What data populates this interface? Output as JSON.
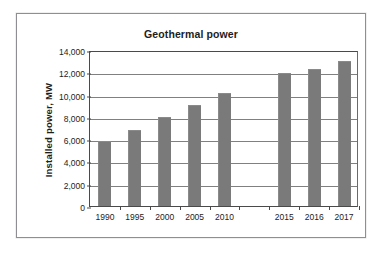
{
  "chart_data": {
    "type": "bar",
    "title": "Geothermal power",
    "xlabel": "",
    "ylabel": "Installed power, MW",
    "categories": [
      "1990",
      "1995",
      "2000",
      "2005",
      "2010",
      "",
      "2015",
      "2016",
      "2017"
    ],
    "values": [
      5800,
      6800,
      8000,
      9100,
      10100,
      null,
      11900,
      12300,
      13000
    ],
    "ylim": [
      0,
      14000
    ],
    "ytick_labels": [
      "0",
      "2,000",
      "4,000",
      "6,000",
      "8,000",
      "10,000",
      "12,000",
      "14,000"
    ],
    "ytick_values": [
      0,
      2000,
      4000,
      6000,
      8000,
      10000,
      12000,
      14000
    ],
    "grid": "horizontal",
    "legend": "none",
    "bar_color": "#7a7a7a",
    "plot_border_color": "#4a4a4a",
    "gridline_color": "#808080",
    "background_color": "#ffffff",
    "frame_border_color": "#8e8e93"
  }
}
